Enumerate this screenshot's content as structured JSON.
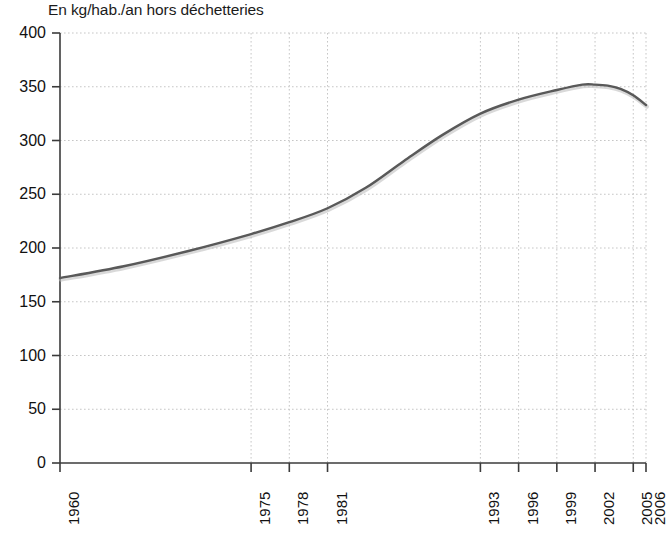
{
  "chart_data": {
    "type": "line",
    "title": "En kg/hab./an hors déchetteries",
    "subtitle": "",
    "xlabel": "",
    "ylabel": "",
    "ylim": [
      0,
      400
    ],
    "ytick_values": [
      0,
      50,
      100,
      150,
      200,
      250,
      300,
      350,
      400
    ],
    "ytick_labels": [
      "0",
      "50",
      "100",
      "150",
      "200",
      "250",
      "300",
      "350",
      "400"
    ],
    "xlim": [
      1960,
      2006
    ],
    "xtick_values": [
      1960,
      1975,
      1978,
      1981,
      1993,
      1996,
      1999,
      2002,
      2005,
      2006
    ],
    "xtick_labels": [
      "1960",
      "1975",
      "1978",
      "1981",
      "1993",
      "1996",
      "1999",
      "2002",
      "2005",
      "2006"
    ],
    "grid": true,
    "grid_style": "dotted",
    "legend": null,
    "series": [
      {
        "name": "Ordures ménagères",
        "color": "#595959",
        "x": [
          1960,
          1965,
          1970,
          1975,
          1978,
          1981,
          1984,
          1987,
          1990,
          1993,
          1996,
          1999,
          2001,
          2002,
          2003,
          2004,
          2005,
          2006
        ],
        "values": [
          172,
          183,
          197,
          213,
          224,
          237,
          256,
          281,
          305,
          325,
          338,
          347,
          352,
          352,
          351,
          348,
          342,
          333
        ]
      }
    ],
    "annotations": []
  },
  "figure": {
    "title": "En kg/hab./an hors déchetteries",
    "footnote": ""
  },
  "axes": {
    "y_axis_name": "y-axis",
    "x_axis_name": "x-axis"
  }
}
